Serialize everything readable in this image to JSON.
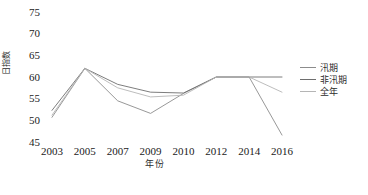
{
  "chart_data": {
    "type": "line",
    "title": "",
    "xlabel": "年份",
    "ylabel": "日指数",
    "categories": [
      "2003",
      "2005",
      "2007",
      "2009",
      "2010",
      "2012",
      "2014",
      "2016"
    ],
    "ylim": [
      45,
      75
    ],
    "yticks": [
      45,
      50,
      55,
      60,
      65,
      70,
      75
    ],
    "grid": false,
    "legend_position": "right",
    "series": [
      {
        "name": "汛期",
        "color": "#8c8c8c",
        "values": [
          50.7,
          62.0,
          54.5,
          51.6,
          56.2,
          60.0,
          60.0,
          46.6
        ]
      },
      {
        "name": "非汛期",
        "color": "#6e6e6e",
        "values": [
          52.3,
          62.0,
          58.3,
          56.5,
          56.3,
          60.0,
          60.0,
          60.0
        ]
      },
      {
        "name": "全年",
        "color": "#b5b5b5",
        "values": [
          51.2,
          62.0,
          57.5,
          55.4,
          55.8,
          60.0,
          60.0,
          56.5
        ]
      }
    ]
  },
  "axes": {
    "y_title": "日指数",
    "x_title": "年份",
    "y_tick_labels": [
      "75",
      "70",
      "65",
      "60",
      "55",
      "50",
      "45"
    ],
    "x_tick_labels": [
      "2003",
      "2005",
      "2007",
      "2009",
      "2010",
      "2012",
      "2014",
      "2016"
    ]
  },
  "legend": {
    "items": [
      {
        "label": "汛期",
        "color": "#8c8c8c"
      },
      {
        "label": "非汛期",
        "color": "#6e6e6e"
      },
      {
        "label": "全年",
        "color": "#b5b5b5"
      }
    ]
  },
  "caption": {
    "text": ""
  }
}
